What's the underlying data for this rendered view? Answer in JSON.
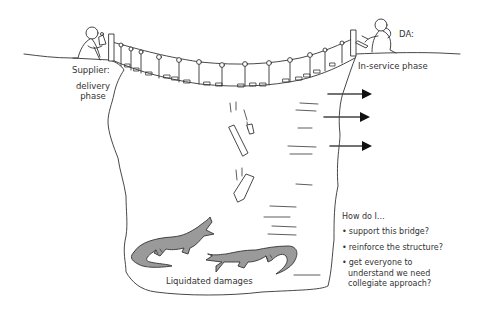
{
  "diagram": {
    "type": "hand-drawn metaphor illustration",
    "colors": {
      "line": "#333333",
      "crocodile_fill": "#9a9a9a",
      "arrow": "#111111",
      "background": "#ffffff"
    }
  },
  "labels": {
    "supplier": "Supplier:",
    "supplier_phase_line1": "delivery",
    "supplier_phase_line2": "phase",
    "da": "DA:",
    "da_phase": "In-service phase",
    "pit": "Liquidated damages"
  },
  "questions": {
    "heading": "How do I…",
    "items": [
      "support this bridge?",
      "reinforce the structure?",
      "get everyone to\nunderstand we need\ncollegiate approach?"
    ]
  },
  "icons": {
    "left_person": "person-with-tool-icon",
    "right_person": "person-with-tool-icon",
    "bridge": "rope-bridge-icon",
    "crocodile": "crocodile-icon",
    "arrow": "arrow-right-icon"
  }
}
